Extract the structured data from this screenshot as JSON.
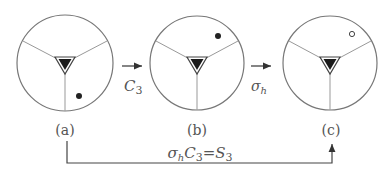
{
  "diagram": {
    "panels": [
      {
        "label": "(a)",
        "dot": "filled-dot",
        "dot_position": "lower-right"
      },
      {
        "label": "(b)",
        "dot": "filled-dot",
        "dot_position": "upper-right"
      },
      {
        "label": "(c)",
        "dot": "open-dot",
        "dot_position": "upper-right"
      }
    ],
    "arrows": [
      {
        "from": "a",
        "to": "b",
        "op_main": "C",
        "op_sub": "3"
      },
      {
        "from": "b",
        "to": "c",
        "op_main": "σ",
        "op_sub": "h"
      }
    ],
    "bottom_arrow": {
      "from": "a",
      "to": "c",
      "sigma": "σ",
      "sigma_sub": "h",
      "c": "C",
      "c_sub": "3",
      "equals": "=",
      "s": "S",
      "s_sub": "3"
    },
    "colors": {
      "line": "#777777",
      "dot": "#222222",
      "triangle": "#1a1a1a"
    }
  }
}
